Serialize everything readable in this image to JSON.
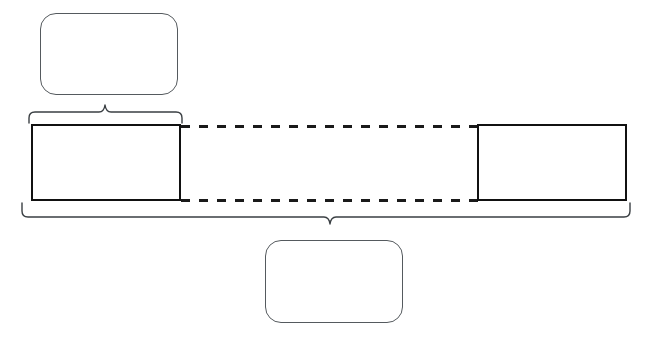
{
  "diagram": {
    "type": "bracket-annotation-diagram",
    "canvas": {
      "width": 655,
      "height": 339,
      "background": "#ffffff"
    },
    "colors": {
      "callout_stroke": "#555a5e",
      "segment_stroke": "#111111",
      "brace_stroke": "#3a3f43",
      "dashed_stroke": "#1a1a1a",
      "background": "#ffffff"
    },
    "top_callout": {
      "label": "",
      "x": 40,
      "y": 13,
      "width": 138,
      "height": 82,
      "corner_radius": 16
    },
    "top_brace": {
      "label": "",
      "x_start": 29,
      "x_end": 182,
      "y": 118,
      "tip_x": 105,
      "direction": "up"
    },
    "left_segment": {
      "label": "",
      "x": 31,
      "y": 124,
      "width": 150,
      "height": 77
    },
    "right_segment": {
      "label": "",
      "x": 477,
      "y": 124,
      "width": 150,
      "height": 77
    },
    "connector_top": {
      "label": "",
      "x_start": 181,
      "x_end": 477,
      "y": 126,
      "style": "dashed",
      "dash": "9 9"
    },
    "connector_bottom": {
      "label": "",
      "x_start": 181,
      "x_end": 477,
      "y": 200,
      "style": "dashed",
      "dash": "9 9"
    },
    "bottom_brace": {
      "label": "",
      "x_start": 22,
      "x_end": 630,
      "y": 208,
      "tip_x": 330,
      "direction": "down"
    },
    "bottom_callout": {
      "label": "",
      "x": 265,
      "y": 240,
      "width": 138,
      "height": 83,
      "corner_radius": 16
    }
  }
}
